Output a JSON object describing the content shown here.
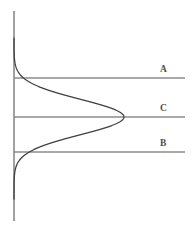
{
  "figure": {
    "width": 194,
    "height": 229,
    "background_color": "#ffffff",
    "axis_color": "#8a8a8a",
    "reference_line_color": "#8d8d8d",
    "curve_color": "#3f3f3f"
  },
  "labels": {
    "upper": "A",
    "middle": "C",
    "lower": "B"
  },
  "chart_data": {
    "type": "line",
    "title": "",
    "subtitle": "",
    "xlabel": "",
    "ylabel": "",
    "orientation": "horizontal-bell-curve",
    "grid": false,
    "legend": null,
    "axes": {
      "vertical_axis": {
        "x": 14,
        "y_top": 11,
        "y_bottom": 221,
        "visible": true
      },
      "horizontal_axis": {
        "visible": false
      }
    },
    "reference_lines": [
      {
        "name": "A",
        "label": "A",
        "orientation": "horizontal",
        "y": 78,
        "x_start": 14,
        "x_end": 185,
        "label_x": 160,
        "label_y": 65,
        "note": "upper reference line, above the peak"
      },
      {
        "name": "C",
        "label": "C",
        "orientation": "horizontal",
        "y": 117,
        "x_start": 14,
        "x_end": 185,
        "label_x": 160,
        "label_y": 104,
        "note": "center reference line, passes through the curve peak"
      },
      {
        "name": "B",
        "label": "B",
        "orientation": "horizontal",
        "y": 152,
        "x_start": 14,
        "x_end": 185,
        "label_x": 160,
        "label_y": 139,
        "note": "lower reference line, below the peak"
      }
    ],
    "curve": {
      "peak": {
        "x": 124,
        "y": 117
      },
      "start": {
        "x": 26,
        "y": 38
      },
      "end": {
        "x": 30,
        "y": 199
      },
      "path": "M 26,38 C 30,62 34,72 44,86 C 54,99 66,95 84,99 C 100,103 116,106 122,117 C 116,129 100,133 84,137 C 66,141 54,137 44,150 C 34,164 30,176 30,199"
    }
  }
}
